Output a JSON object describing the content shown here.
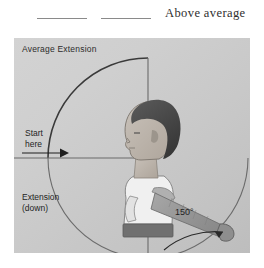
{
  "header": {
    "blank_line_1": "",
    "blank_line_2": "",
    "label": "Above average"
  },
  "diagram": {
    "title": "Average Extension",
    "start_label": "Start\nhere",
    "motion_label": "Extension\n(down)",
    "angle_label": "150°",
    "colors": {
      "panel_light": "#d3d3d3",
      "panel_dark": "#bdbdbd",
      "arc_stroke": "#3a3a3a",
      "axis_stroke": "#6b6b6b",
      "skin": "#bdb5ad",
      "hair": "#4a4a4a",
      "shirt": "#f2f2f2",
      "waistband": "#6f6f6f",
      "arm": "#9a9a9a",
      "text": "#1f1f1f"
    },
    "geometry": {
      "center_x": 134,
      "center_y": 120,
      "radius": 100,
      "angle_degrees": 150
    }
  }
}
